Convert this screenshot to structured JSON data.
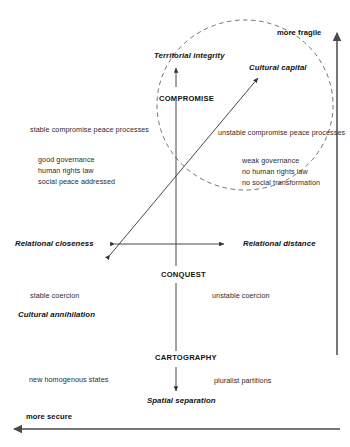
{
  "diagram": {
    "type": "conceptual-quadrant-diagram",
    "stroke_color": "#333333",
    "text_color": "#1a1a1a",
    "background": "#ffffff"
  },
  "axes": {
    "horizontal": {
      "left_label": "Relational closeness",
      "right_label": "Relational distance"
    },
    "outer_vertical": {
      "top_label": "more fragile"
    },
    "outer_horizontal": {
      "left_label": "more secure"
    }
  },
  "poles": {
    "territorial_integrity": "Territorial integrity",
    "cultural_capital": "Cultural capital",
    "cultural_annihilation": "Cultural annihilation",
    "spatial_separation": "Spatial separation"
  },
  "processes": {
    "compromise": "COMPROMISE",
    "conquest": "CONQUEST",
    "cartography": "CARTOGRAPHY"
  },
  "annotations": {
    "stable_compromise": "stable compromise peace processes",
    "unstable_compromise": "unstable compromise peace processes",
    "good_governance": "good governance",
    "human_rights_law": "human rights law",
    "social_peace_addressed": "social peace addressed",
    "weak_governance": "weak governance",
    "no_human_rights_law": "no human rights law",
    "no_social_transformation": "no social transformation",
    "stable_coercion": "stable coercion",
    "unstable_coercion": "unstable coercion",
    "new_homogenous_states": "new homogenous states",
    "pluralist_partitions": "pluralist partitions"
  },
  "shapes": {
    "dashed_circle_name": "fragility-zone-circle",
    "diagonal_arrow_name": "closeness-to-cultural-capital-arrow"
  }
}
